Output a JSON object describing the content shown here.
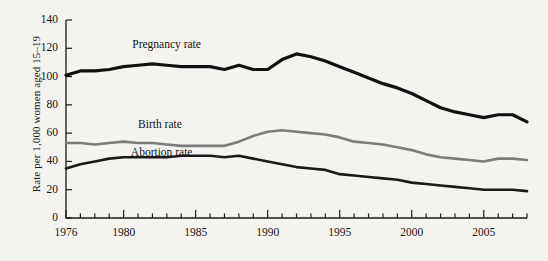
{
  "chart_data": {
    "type": "line",
    "title": "",
    "xlabel": "",
    "ylabel": "Rate per 1,000 women aged 15–19",
    "xlim": [
      1976,
      2008
    ],
    "ylim": [
      0,
      140
    ],
    "yticks": [
      0,
      20,
      40,
      60,
      80,
      100,
      120,
      140
    ],
    "ytick_labels": [
      "0",
      "20",
      "40",
      "60",
      "80",
      "100",
      "120",
      "140"
    ],
    "xticks": [
      1976,
      1977,
      1978,
      1979,
      1980,
      1981,
      1982,
      1983,
      1984,
      1985,
      1986,
      1987,
      1988,
      1989,
      1990,
      1991,
      1992,
      1993,
      1994,
      1995,
      1996,
      1997,
      1998,
      1999,
      2000,
      2001,
      2002,
      2003,
      2004,
      2005,
      2006,
      2007,
      2008
    ],
    "xtick_labels_shown": [
      "1976",
      "1980",
      "1985",
      "1990",
      "1995",
      "2000",
      "2005"
    ],
    "grid": false,
    "legend_position": "inline-annotations",
    "x": [
      1976,
      1977,
      1978,
      1979,
      1980,
      1981,
      1982,
      1983,
      1984,
      1985,
      1986,
      1987,
      1988,
      1989,
      1990,
      1991,
      1992,
      1993,
      1994,
      1995,
      1996,
      1997,
      1998,
      1999,
      2000,
      2001,
      2002,
      2003,
      2004,
      2005,
      2006,
      2007,
      2008
    ],
    "series": [
      {
        "name": "Pregnancy rate",
        "color": "#111111",
        "width": 3.2,
        "values": [
          101,
          104,
          104,
          105,
          107,
          108,
          109,
          108,
          107,
          107,
          107,
          105,
          108,
          105,
          105,
          112,
          116,
          114,
          111,
          107,
          103,
          99,
          95,
          92,
          88,
          83,
          78,
          75,
          73,
          71,
          73,
          73,
          68
        ]
      },
      {
        "name": "Birth rate",
        "color": "#7c7c7c",
        "width": 2.6,
        "values": [
          53,
          53,
          52,
          53,
          54,
          53,
          53,
          52,
          51,
          51,
          51,
          51,
          54,
          58,
          61,
          62,
          61,
          60,
          59,
          57,
          54,
          53,
          52,
          50,
          48,
          45,
          43,
          42,
          41,
          40,
          42,
          42,
          41
        ]
      },
      {
        "name": "Abortion rate",
        "color": "#1a1a1a",
        "width": 2.6,
        "values": [
          35,
          38,
          40,
          42,
          43,
          43,
          43,
          43,
          44,
          44,
          44,
          43,
          44,
          42,
          40,
          38,
          36,
          35,
          34,
          31,
          30,
          29,
          28,
          27,
          25,
          24,
          23,
          22,
          21,
          20,
          20,
          20,
          19
        ]
      }
    ],
    "annotations": [
      {
        "text": "Pregnancy rate",
        "x": 1980.6,
        "y": 122
      },
      {
        "text": "Birth rate",
        "x": 1981.0,
        "y": 66
      },
      {
        "text": "Abortion rate",
        "x": 1980.5,
        "y": 46
      }
    ]
  },
  "axis": {
    "ylabel": "Rate per 1,000 women aged 15–19"
  }
}
